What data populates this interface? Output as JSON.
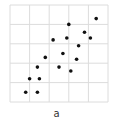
{
  "chart_data": {
    "type": "scatter",
    "title": "",
    "xlabel": "",
    "ylabel": "",
    "caption": "a",
    "grid": true,
    "grid_color": "#dcdcdc",
    "marker_color": "#111111",
    "plot_area": {
      "left": 10,
      "top": 5,
      "right": 108,
      "bottom": 102
    },
    "grid_columns": 5,
    "grid_rows": 5,
    "xlim": [
      0,
      5
    ],
    "ylim": [
      0,
      5
    ],
    "points": [
      {
        "x": 4.4,
        "y": 4.3
      },
      {
        "x": 3.0,
        "y": 4.0
      },
      {
        "x": 3.8,
        "y": 3.6
      },
      {
        "x": 2.2,
        "y": 3.2
      },
      {
        "x": 2.9,
        "y": 3.3
      },
      {
        "x": 4.1,
        "y": 3.3
      },
      {
        "x": 3.5,
        "y": 2.9
      },
      {
        "x": 2.7,
        "y": 2.5
      },
      {
        "x": 1.8,
        "y": 2.3
      },
      {
        "x": 3.4,
        "y": 2.2
      },
      {
        "x": 1.4,
        "y": 1.8
      },
      {
        "x": 2.5,
        "y": 1.8
      },
      {
        "x": 3.1,
        "y": 1.6
      },
      {
        "x": 1.0,
        "y": 1.2
      },
      {
        "x": 1.5,
        "y": 1.2
      },
      {
        "x": 0.8,
        "y": 0.5
      },
      {
        "x": 1.4,
        "y": 0.5
      }
    ]
  }
}
